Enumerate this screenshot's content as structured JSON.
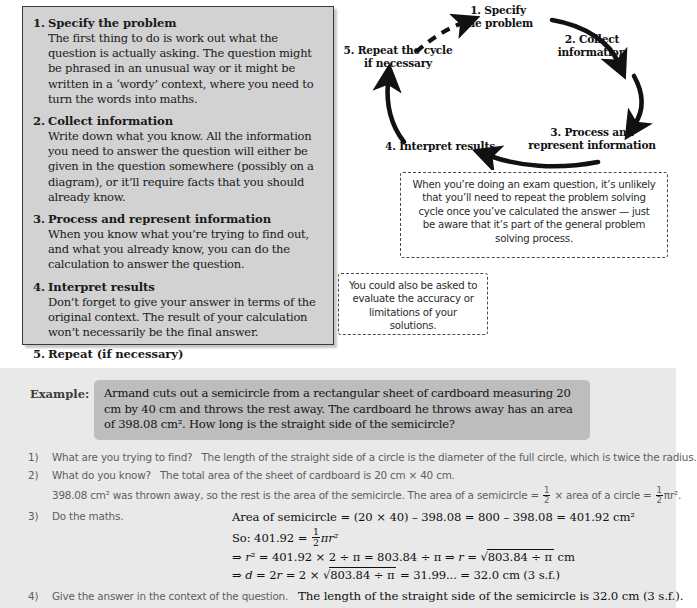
{
  "steps_panel": {
    "steps": [
      {
        "num": "1.",
        "title": "Specify the problem",
        "body": "The first thing to do is work out what the question is actually asking.  The question might be phrased in an unusual way or it might be written in a ‘wordy’ context, where you need to turn the words into maths."
      },
      {
        "num": "2.",
        "title": "Collect information",
        "body": "Write down what you know.  All the information you need to answer the question will either be given in the question somewhere (possibly on a diagram), or it’ll require facts that you should already know."
      },
      {
        "num": "3.",
        "title": "Process and represent information",
        "body": "When you know what you’re trying to find out, and what you already know, you can do the calculation to answer the question."
      },
      {
        "num": "4.",
        "title": "Interpret results",
        "body": "Don’t forget to give your answer in terms of the original context.  The result of your calculation won’t necessarily be the final answer."
      },
      {
        "num": "5.",
        "title": "Repeat (if necessary)",
        "body": ""
      }
    ]
  },
  "cycle": {
    "node_1": "1. Specify\nthe problem",
    "node_2": "2. Collect\ninformation",
    "node_3": "3. Process and\nrepresent information",
    "node_4": "4. Interpret results",
    "node_5": "5. Repeat the cycle\nif necessary"
  },
  "callouts": {
    "exam_note": "When you’re doing an exam question, it’s unlikely that you’ll need to repeat the problem solving cycle once you’ve calculated the answer — just be aware that it’s part of the general problem solving process.",
    "evaluate_note": "You could also be asked to evaluate the accuracy or limitations of your solutions."
  },
  "example": {
    "tag": "Example:",
    "question": "Armand cuts out a semicircle from a rectangular sheet of cardboard measuring 20 cm by 40 cm and throws the rest away.  The cardboard he throws away has an area of 398.08 cm².  How long is the straight side of the semicircle?",
    "solution": [
      {
        "num": "1)",
        "prompt": "What are you trying to find?",
        "text": "The length of the straight side of a circle is the diameter of the full circle, which is twice the radius."
      },
      {
        "num": "2)",
        "prompt": "What do you know?",
        "text": "The total area of the sheet of cardboard is 20 cm × 40 cm.",
        "cont_a": "398.08 cm² was thrown away, so the rest is the area of the semicircle.  The area of a semicircle = ",
        "cont_frac_num": "1",
        "cont_frac_den": "2",
        "cont_b": " × area of a circle = ",
        "cont_c": "πr²."
      },
      {
        "num": "3)",
        "prompt": "Do the maths.",
        "line1": "Area of semicircle = (20 × 40) – 398.08 = 800 – 398.08 = 401.92 cm²",
        "line2_pre": "So: 401.92 = ",
        "line2_num": "1",
        "line2_den": "2",
        "line2_post": "πr²",
        "line3_a": "⇒ ",
        "line3_b": "r",
        "line3_c": "² = 401.92 × 2 ÷ π = 803.84 ÷ π  ⇒  ",
        "line3_d": "r",
        "line3_e": " = ",
        "line3_f": "803.84 ÷ π",
        "line3_g": "  cm",
        "line4_a": "⇒  ",
        "line4_b": "d",
        "line4_c": " = 2",
        "line4_d": "r",
        "line4_e": " = 2 × ",
        "line4_f": "803.84 ÷ π",
        "line4_g": " = 31.99... = 32.0 cm (3 s.f.)"
      },
      {
        "num": "4)",
        "prompt": "Give the answer in the context of the question.",
        "answer": "The length of the straight side of the semicircle is 32.0 cm (3 s.f.)."
      }
    ]
  },
  "colors": {
    "panel_bg": "#d2d2d2",
    "panel_border": "#3a3a3a",
    "band_bg": "#e9e9e9",
    "question_bg": "#bdbdbd",
    "ink": "#1a1a1a",
    "muted_ink": "#5e5e5e"
  }
}
